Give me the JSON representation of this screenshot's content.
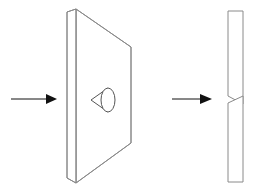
{
  "drawing": {
    "title": "Countersunk plate — isometric view with section view",
    "background_color": "#ffffff",
    "line_color": "#8a8a8a",
    "detail_line_color": "#555555",
    "arrow_color": "#111111",
    "canvas": {
      "width": 257,
      "height": 193
    },
    "left_arrow": {
      "name": "flow-arrow-left",
      "label": "",
      "shaft_start_x": 11,
      "shaft_end_x": 48,
      "y": 99,
      "tip_x": 57,
      "head_half_height": 5
    },
    "right_arrow": {
      "name": "flow-arrow-right",
      "label": "",
      "shaft_start_x": 172,
      "shaft_end_x": 202,
      "y": 99,
      "tip_x": 212,
      "head_half_height": 5
    },
    "isometric_plate": {
      "name": "tapered-plate-isometric",
      "near_face_points": "67,12 76,9 76,183 67,178",
      "body_points": "76,9 131,47 131,143 76,183",
      "left_edge_x": 67,
      "front_edge_x": 76,
      "right_edge_x": 131,
      "top_near_y": 9,
      "bottom_near_y": 183,
      "top_far_y": 47,
      "bottom_far_y": 143
    },
    "countersink_hole": {
      "name": "countersunk-hole",
      "ellipse_cx": 108,
      "ellipse_cy": 100,
      "ellipse_rx": 7,
      "ellipse_ry": 12,
      "cone_apex_x": 91,
      "cone_apex_y": 100,
      "cone_top_x": 108,
      "cone_top_y": 88,
      "cone_bottom_x": 108,
      "cone_bottom_y": 112
    },
    "section_view": {
      "name": "plate-section-view",
      "upper_points": "228,11 243,11 243,104 228,96",
      "lower_points": "228,103 243,96 243,182 228,182",
      "left_x": 228,
      "right_x": 243,
      "top_y": 11,
      "bottom_y": 182,
      "notch_tip_y_upper": 96,
      "notch_tip_y_lower": 103,
      "notch_throat_y": 100
    }
  }
}
